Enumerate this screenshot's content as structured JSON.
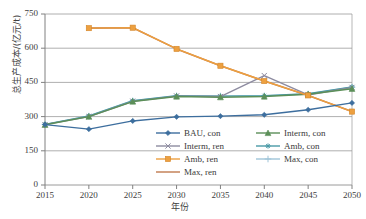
{
  "chart_data": {
    "type": "line",
    "title": "",
    "xlabel": "年份",
    "ylabel": "总生产成本/(亿元/t)",
    "x": [
      2015,
      2020,
      2025,
      2030,
      2035,
      2040,
      2045,
      2050
    ],
    "xtick_labels": [
      "2015",
      "2020",
      "2025",
      "2030",
      "2035",
      "2040",
      "2045",
      "2050"
    ],
    "ytick_labels": [
      "0",
      "150",
      "300",
      "450",
      "600",
      "750"
    ],
    "yticks": [
      0,
      150,
      300,
      450,
      600,
      750
    ],
    "ylim": [
      0,
      750
    ],
    "xlim": [
      2015,
      2050
    ],
    "grid": "horizontal",
    "legend_position": "inside-lower-right",
    "series": [
      {
        "name": "BAU, con",
        "color": "#3d6e9e",
        "marker": "diamond",
        "values": [
          265,
          245,
          281,
          299,
          302,
          308,
          330,
          360
        ]
      },
      {
        "name": "Interm, con",
        "color": "#5b8f58",
        "marker": "triangle",
        "values": [
          264,
          300,
          366,
          388,
          385,
          388,
          398,
          422
        ]
      },
      {
        "name": "Interm, ren",
        "color": "#8d8ba0",
        "marker": "x",
        "values": [
          265,
          300,
          367,
          390,
          388,
          480,
          395,
          428
        ]
      },
      {
        "name": "Amb, con",
        "color": "#4a9aa6",
        "marker": "asterisk",
        "values": [
          266,
          303,
          370,
          392,
          390,
          392,
          400,
          430
        ]
      },
      {
        "name": "Amb, ren",
        "color": "#eda040",
        "marker": "square",
        "values": [
          null,
          688,
          690,
          597,
          523,
          456,
          393,
          322
        ]
      },
      {
        "name": "Max, con",
        "color": "#9fc4d8",
        "marker": "plus",
        "values": [
          266,
          302,
          369,
          391,
          390,
          391,
          399,
          429
        ]
      },
      {
        "name": "Max, ren",
        "color": "#c07a4e",
        "marker": "line",
        "values": [
          null,
          688,
          690,
          597,
          523,
          456,
          393,
          322
        ]
      }
    ]
  },
  "legend": {
    "rows": [
      [
        {
          "label": "BAU, con",
          "color": "#3d6e9e",
          "marker": "diamond"
        },
        {
          "label": "Interm, con",
          "color": "#5b8f58",
          "marker": "triangle"
        }
      ],
      [
        {
          "label": "Interm, ren",
          "color": "#8d8ba0",
          "marker": "x"
        },
        {
          "label": "Amb, con",
          "color": "#4a9aa6",
          "marker": "asterisk"
        }
      ],
      [
        {
          "label": "Amb, ren",
          "color": "#eda040",
          "marker": "square"
        },
        {
          "label": "Max, con",
          "color": "#9fc4d8",
          "marker": "plus"
        }
      ],
      [
        {
          "label": "Max, ren",
          "color": "#c07a4e",
          "marker": "line"
        }
      ]
    ]
  }
}
